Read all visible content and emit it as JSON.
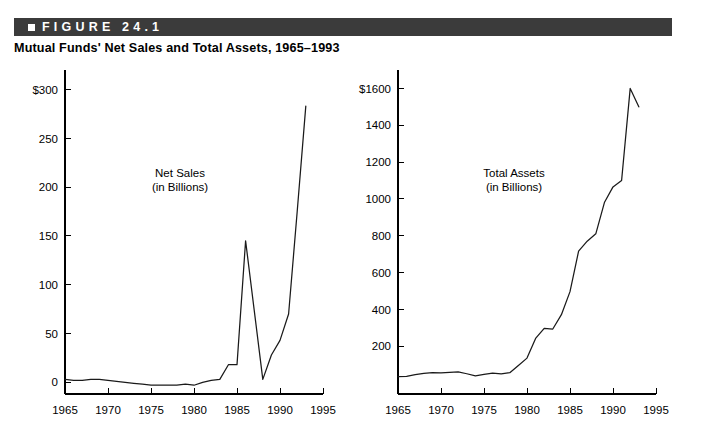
{
  "figure": {
    "banner_label": "FIGURE 24.1",
    "banner_bg": "#3b3b3b",
    "banner_marker_icon": "square-bullet-icon",
    "title": "Mutual Funds' Net Sales and Total Assets, 1965–1993"
  },
  "chart_data": [
    {
      "type": "line",
      "id": "net-sales",
      "title": "Net Sales",
      "subtitle": "(in Billions)",
      "annotation_lines": [
        "Net Sales",
        "(in Billions)"
      ],
      "xlabel": "",
      "ylabel": "",
      "xlim": [
        1965,
        1995
      ],
      "ylim": [
        -12,
        320
      ],
      "grid": false,
      "legend": "none",
      "line_color": "#1a1a1a",
      "xticks": [
        1965,
        1970,
        1975,
        1980,
        1985,
        1990,
        1995
      ],
      "xtick_labels": [
        "1965",
        "1970",
        "1975",
        "1980",
        "1985",
        "1990",
        "1995"
      ],
      "yticks": [
        0,
        50,
        100,
        150,
        200,
        250,
        300
      ],
      "ytick_labels": [
        "0",
        "50",
        "100",
        "150",
        "200",
        "250",
        "$300"
      ],
      "x": [
        1965,
        1966,
        1967,
        1968,
        1969,
        1970,
        1971,
        1972,
        1973,
        1974,
        1975,
        1976,
        1977,
        1978,
        1979,
        1980,
        1981,
        1982,
        1983,
        1984,
        1985,
        1986,
        1987,
        1988,
        1989,
        1990,
        1991,
        1992,
        1993
      ],
      "values": [
        3,
        2,
        2,
        3,
        3,
        2,
        1,
        0,
        -1,
        -2,
        -3,
        -3,
        -3,
        -3,
        -2,
        -3,
        0,
        2,
        3,
        18,
        18,
        145,
        74,
        3,
        28,
        43,
        70,
        175,
        283
      ]
    },
    {
      "type": "line",
      "id": "total-assets",
      "title": "Total Assets",
      "subtitle": "(in Billions)",
      "annotation_lines": [
        "Total Assets",
        "(in Billions)"
      ],
      "xlabel": "",
      "ylabel": "",
      "xlim": [
        1965,
        1995
      ],
      "ylim": [
        -60,
        1700
      ],
      "grid": false,
      "legend": "none",
      "line_color": "#1a1a1a",
      "xticks": [
        1965,
        1970,
        1975,
        1980,
        1985,
        1990,
        1995
      ],
      "xtick_labels": [
        "1965",
        "1970",
        "1975",
        "1980",
        "1985",
        "1990",
        "1995"
      ],
      "yticks": [
        200,
        400,
        600,
        800,
        1000,
        1200,
        1400,
        1600
      ],
      "ytick_labels": [
        "200",
        "400",
        "600",
        "800",
        "1000",
        "1200",
        "1400",
        "$1600"
      ],
      "x": [
        1965,
        1966,
        1967,
        1968,
        1969,
        1970,
        1971,
        1972,
        1973,
        1974,
        1975,
        1976,
        1977,
        1978,
        1979,
        1980,
        1981,
        1982,
        1983,
        1984,
        1985,
        1986,
        1987,
        1988,
        1989,
        1990,
        1991,
        1992,
        1993
      ],
      "values": [
        35,
        36,
        45,
        52,
        56,
        55,
        58,
        60,
        50,
        38,
        46,
        54,
        49,
        56,
        95,
        135,
        242,
        297,
        293,
        371,
        496,
        716,
        770,
        810,
        980,
        1065,
        1100,
        1600,
        1500
      ]
    }
  ]
}
